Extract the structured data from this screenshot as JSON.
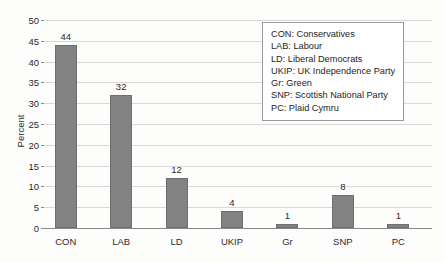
{
  "chart_data": {
    "type": "bar",
    "title": "",
    "xlabel": "",
    "ylabel": "Percent",
    "categories": [
      "CON",
      "LAB",
      "LD",
      "UKIP",
      "Gr",
      "SNP",
      "PC"
    ],
    "values": [
      44,
      32,
      12,
      4,
      1,
      8,
      1
    ],
    "value_labels": [
      "44",
      "32",
      "12",
      "4",
      "1",
      "8",
      "1"
    ],
    "ylim": [
      0,
      50
    ],
    "ytick_step": 5,
    "ytick_labels": [
      "0",
      "5",
      "10",
      "15",
      "20",
      "25",
      "30",
      "35",
      "40",
      "45",
      "50"
    ],
    "grid": true,
    "legend_position": "top-right",
    "legend_entries": [
      "CON: Conservatives",
      "LAB: Labour",
      "LD: Liberal Democrats",
      "UKIP: UK Independence Party",
      "Gr: Green",
      "SNP: Scottish National Party",
      "PC: Plaid Cymru"
    ],
    "colors": {
      "bar_fill": "#838383",
      "bar_border": "#6e6e6e",
      "gridline": "#d8d8d8",
      "axis": "#8a8a8a",
      "text": "#2b2b2b",
      "background": "#fdfdfc",
      "legend_background": "#ffffff",
      "legend_border": "#9a9a9a"
    }
  }
}
